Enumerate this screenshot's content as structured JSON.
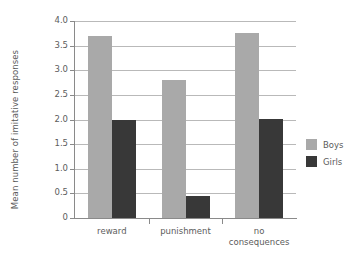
{
  "chart_data": {
    "type": "bar",
    "title": "",
    "subtitle": "",
    "xlabel": "",
    "ylabel": "Mean number of imitative responses",
    "categories": [
      "reward",
      "punishment",
      "no\nconsequences"
    ],
    "series": [
      {
        "name": "Boys",
        "color": "#a9a9a9",
        "values": [
          3.7,
          2.8,
          3.75
        ]
      },
      {
        "name": "Girls",
        "color": "#383838",
        "values": [
          2.0,
          0.45,
          2.02
        ]
      }
    ],
    "ylim": [
      0,
      4.0
    ],
    "ytick_values": [
      0,
      0.5,
      1.0,
      1.5,
      2.0,
      2.5,
      3.0,
      3.5,
      4.0
    ],
    "ytick_labels": [
      "0",
      "0.5",
      "1.0",
      "1.5",
      "2.0",
      "2.5",
      "3.0",
      "3.5",
      "4.0"
    ],
    "grid": true,
    "grid_axis": "y",
    "legend_position": "right",
    "legend_entries": [
      "Boys",
      "Girls"
    ],
    "background_color": "#ffffff",
    "axis_color": "#8a8a8a",
    "grid_color": "#b9b9b9",
    "text_color": "#5c5c5c"
  }
}
